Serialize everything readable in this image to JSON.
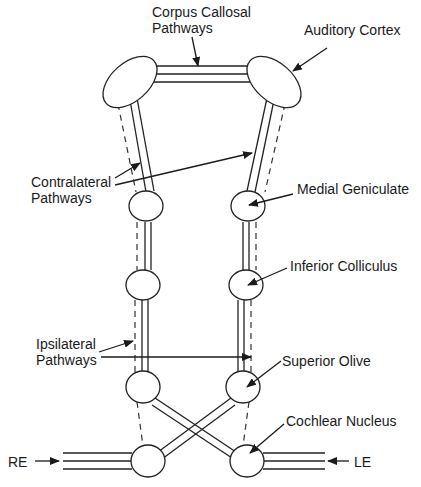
{
  "labels": {
    "corpus_callosal_line1": "Corpus Callosal",
    "corpus_callosal_line2": "Pathways",
    "auditory_cortex": "Auditory Cortex",
    "contralateral_line1": "Contralateral",
    "contralateral_line2": "Pathways",
    "medial_geniculate": "Medial Geniculate",
    "inferior_colliculus": "Inferior Colliculus",
    "ipsilateral_line1": "Ipsilateral",
    "ipsilateral_line2": "Pathways",
    "superior_olive": "Superior Olive",
    "cochlear_nucleus": "Cochlear Nucleus",
    "right_ear": "RE",
    "left_ear": "LE"
  },
  "structures": [
    "Auditory Cortex",
    "Medial Geniculate",
    "Inferior Colliculus",
    "Superior Olive",
    "Cochlear Nucleus"
  ],
  "pathways": [
    "Corpus Callosal Pathways",
    "Contralateral Pathways",
    "Ipsilateral Pathways"
  ],
  "colors": {
    "line": "#222222",
    "background": "#ffffff"
  }
}
